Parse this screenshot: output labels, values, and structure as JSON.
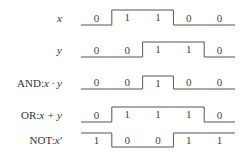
{
  "diagram": {
    "type": "timing-diagram",
    "colors": {
      "line": "#555555",
      "text": "#333333",
      "background": "#ffffff"
    },
    "signals": [
      {
        "id": "x",
        "label_prefix": "",
        "label_expr": "x",
        "bits": [
          "0",
          "1",
          "1",
          "0",
          "0"
        ]
      },
      {
        "id": "y",
        "label_prefix": "",
        "label_expr": "y",
        "bits": [
          "0",
          "0",
          "1",
          "1",
          "0"
        ]
      },
      {
        "id": "and",
        "label_prefix": "AND:",
        "label_expr": "x · y",
        "bits": [
          "0",
          "0",
          "1",
          "0",
          "0"
        ]
      },
      {
        "id": "or",
        "label_prefix": "OR:",
        "label_expr": "x + y",
        "bits": [
          "0",
          "1",
          "1",
          "1",
          "0"
        ]
      },
      {
        "id": "not",
        "label_prefix": "NOT:",
        "label_expr": "x′",
        "bits": [
          "1",
          "0",
          "0",
          "1",
          "1"
        ]
      }
    ]
  }
}
